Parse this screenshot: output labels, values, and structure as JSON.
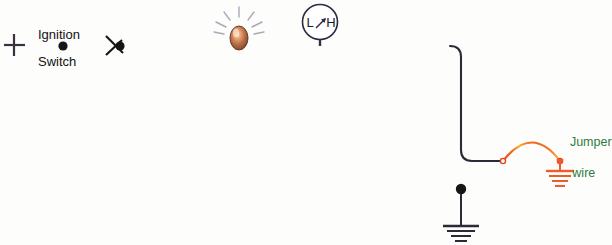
{
  "diagram": {
    "background_color": "#fdfdfb"
  },
  "labels": {
    "ignition": "Ignition",
    "switch": "Switch",
    "jumper_line1": "Jumper",
    "jumper_line2": "wire"
  },
  "gauge": {
    "low_label": "L",
    "high_label": "H",
    "needle_direction": "up-right",
    "name": "fuel-or-temp-gauge"
  },
  "components": {
    "positive_terminal": "+",
    "ignition_switch": "open-switch-with-node",
    "lamp": "illuminated-bulb",
    "jumper_wire": "jumper-arc",
    "ground_connected": "ground-symbol-orange",
    "ground_open": "ground-symbol-black-with-node"
  },
  "colors": {
    "wire": "#2b2b38",
    "wire_tint": "#6b4a63",
    "jumper": "#f2621f",
    "jumper_highlight": "#f5a623",
    "ground_orange": "#ef5a2a",
    "label_text": "#111111",
    "jumper_text": "#2f7d3f",
    "bulb_body": "#a85c3c",
    "bulb_highlight": "#f3c9a8",
    "ray": "#b8b8c4",
    "gauge_stroke": "#2b2b45",
    "background": "#fdfdfb"
  }
}
